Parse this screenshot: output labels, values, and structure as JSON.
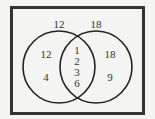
{
  "diagram": {
    "type": "venn",
    "universe_border_color": "#333333",
    "circle_stroke_color": "#222222",
    "sets": [
      {
        "name": "left",
        "title": "12",
        "elements": [
          "12",
          "4"
        ]
      },
      {
        "name": "right",
        "title": "18",
        "elements": [
          "18",
          "9"
        ]
      }
    ],
    "intersection": [
      "1",
      "2",
      "3",
      "6"
    ]
  }
}
